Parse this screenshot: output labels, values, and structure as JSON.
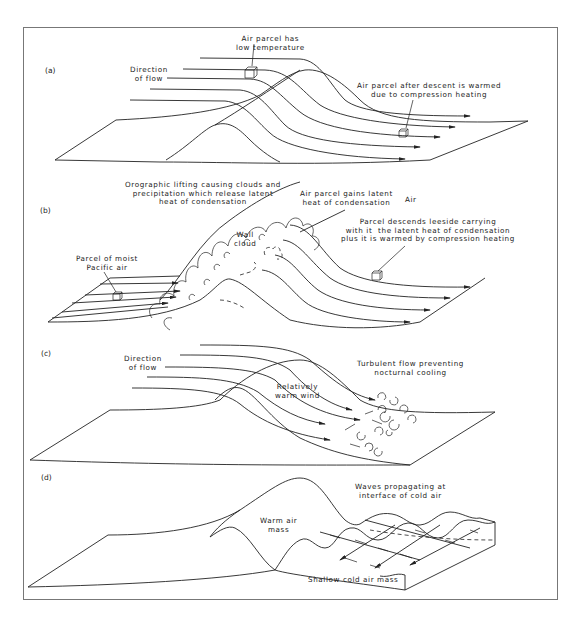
{
  "figure": {
    "panels": [
      {
        "id": "(a)",
        "labels": {
          "parcel_top": "Air parcel has\nlow temperature",
          "direction": "Direction\nof flow",
          "parcel_descent": "Air parcel after descent is warmed\ndue to compression heating"
        }
      },
      {
        "id": "(b)",
        "labels": {
          "orographic": "Orographic lifting causing clouds and\nprecipitation which release latent\nheat of condensation",
          "gains_latent": "Air parcel gains latent\nheat of condensation",
          "air": "Air",
          "wall_cloud": "Wall\ncloud",
          "moist_parcel": "Parcel of moist\nPacific air",
          "descends": "Parcel descends leeside carrying\nwith it  the latent heat of condensation\nplus it is warmed by compression heating"
        }
      },
      {
        "id": "(c)",
        "labels": {
          "direction": "Direction\nof flow",
          "turbulent": "Turbulent flow preventing\nnocturnal cooling",
          "warm_wind": "Relatively\nwarm wind"
        }
      },
      {
        "id": "(d)",
        "labels": {
          "waves": "Waves propagating at\ninterface of cold air",
          "warm_mass": "Warm air\nmass",
          "cold_mass": "Shallow cold air mass"
        }
      }
    ]
  }
}
